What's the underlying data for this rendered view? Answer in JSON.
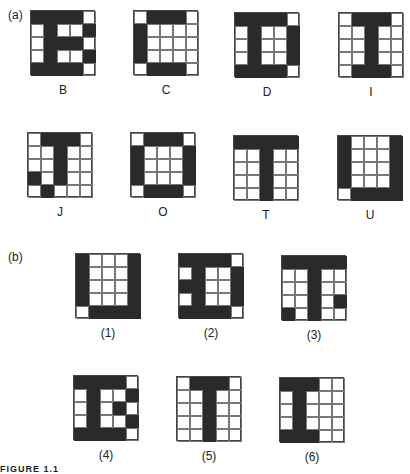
{
  "part_a": {
    "label": "(a)",
    "patterns": [
      {
        "name": "B",
        "grid": [
          [
            1,
            1,
            1,
            1,
            0
          ],
          [
            0,
            1,
            0,
            0,
            1
          ],
          [
            0,
            1,
            1,
            1,
            0
          ],
          [
            0,
            1,
            0,
            0,
            1
          ],
          [
            1,
            1,
            1,
            1,
            0
          ]
        ]
      },
      {
        "name": "C",
        "grid": [
          [
            0,
            1,
            1,
            1,
            0
          ],
          [
            1,
            0,
            0,
            0,
            0
          ],
          [
            1,
            0,
            0,
            0,
            0
          ],
          [
            1,
            0,
            0,
            0,
            0
          ],
          [
            0,
            1,
            1,
            1,
            0
          ]
        ]
      },
      {
        "name": "D",
        "grid": [
          [
            1,
            1,
            1,
            1,
            0
          ],
          [
            0,
            1,
            0,
            0,
            1
          ],
          [
            0,
            1,
            0,
            0,
            1
          ],
          [
            0,
            1,
            0,
            0,
            1
          ],
          [
            1,
            1,
            1,
            1,
            0
          ]
        ]
      },
      {
        "name": "I",
        "grid": [
          [
            0,
            1,
            1,
            1,
            0
          ],
          [
            0,
            0,
            1,
            0,
            0
          ],
          [
            0,
            0,
            1,
            0,
            0
          ],
          [
            0,
            0,
            1,
            0,
            0
          ],
          [
            0,
            1,
            1,
            1,
            0
          ]
        ]
      },
      {
        "name": "J",
        "grid": [
          [
            0,
            1,
            1,
            1,
            0
          ],
          [
            0,
            0,
            1,
            0,
            0
          ],
          [
            0,
            0,
            1,
            0,
            0
          ],
          [
            1,
            0,
            1,
            0,
            0
          ],
          [
            0,
            1,
            0,
            0,
            0
          ]
        ]
      },
      {
        "name": "O",
        "grid": [
          [
            0,
            1,
            1,
            1,
            0
          ],
          [
            1,
            0,
            0,
            0,
            1
          ],
          [
            1,
            0,
            0,
            0,
            1
          ],
          [
            1,
            0,
            0,
            0,
            1
          ],
          [
            0,
            1,
            1,
            1,
            0
          ]
        ]
      },
      {
        "name": "T",
        "grid": [
          [
            1,
            1,
            1,
            1,
            1
          ],
          [
            0,
            0,
            1,
            0,
            0
          ],
          [
            0,
            0,
            1,
            0,
            0
          ],
          [
            0,
            0,
            1,
            0,
            0
          ],
          [
            0,
            0,
            1,
            0,
            0
          ]
        ]
      },
      {
        "name": "U",
        "grid": [
          [
            1,
            0,
            0,
            0,
            1
          ],
          [
            1,
            0,
            0,
            0,
            1
          ],
          [
            1,
            0,
            0,
            0,
            1
          ],
          [
            1,
            0,
            0,
            0,
            1
          ],
          [
            0,
            1,
            1,
            1,
            1
          ]
        ]
      }
    ]
  },
  "part_b": {
    "label": "(b)",
    "patterns": [
      {
        "name": "(1)",
        "grid": [
          [
            1,
            0,
            0,
            0,
            1
          ],
          [
            1,
            0,
            0,
            0,
            1
          ],
          [
            1,
            0,
            0,
            0,
            1
          ],
          [
            1,
            0,
            0,
            0,
            1
          ],
          [
            0,
            1,
            1,
            1,
            1
          ]
        ]
      },
      {
        "name": "(2)",
        "grid": [
          [
            1,
            1,
            1,
            1,
            0
          ],
          [
            0,
            1,
            0,
            0,
            1
          ],
          [
            1,
            1,
            0,
            0,
            1
          ],
          [
            0,
            1,
            0,
            0,
            1
          ],
          [
            1,
            1,
            1,
            1,
            0
          ]
        ]
      },
      {
        "name": "(3)",
        "grid": [
          [
            1,
            1,
            1,
            1,
            1
          ],
          [
            0,
            0,
            1,
            0,
            0
          ],
          [
            0,
            0,
            1,
            0,
            0
          ],
          [
            0,
            0,
            1,
            0,
            1
          ],
          [
            1,
            0,
            1,
            0,
            0
          ]
        ]
      },
      {
        "name": "(4)",
        "grid": [
          [
            1,
            1,
            1,
            1,
            0
          ],
          [
            0,
            1,
            0,
            0,
            1
          ],
          [
            0,
            1,
            0,
            1,
            0
          ],
          [
            0,
            1,
            0,
            0,
            1
          ],
          [
            1,
            1,
            1,
            1,
            0
          ]
        ]
      },
      {
        "name": "(5)",
        "grid": [
          [
            0,
            1,
            1,
            1,
            0
          ],
          [
            0,
            0,
            1,
            0,
            0
          ],
          [
            0,
            0,
            1,
            0,
            0
          ],
          [
            0,
            0,
            1,
            0,
            0
          ],
          [
            0,
            0,
            1,
            0,
            0
          ]
        ]
      },
      {
        "name": "(6)",
        "grid": [
          [
            1,
            1,
            1,
            0,
            0
          ],
          [
            0,
            1,
            0,
            0,
            0
          ],
          [
            0,
            1,
            0,
            0,
            0
          ],
          [
            0,
            1,
            0,
            0,
            0
          ],
          [
            1,
            1,
            1,
            0,
            0
          ]
        ]
      }
    ]
  },
  "caption": "FIGURE 1.1"
}
